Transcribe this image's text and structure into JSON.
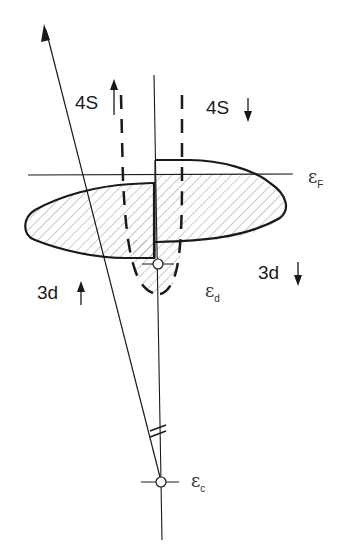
{
  "diagram": {
    "labels": {
      "spin_up_4s": "4S",
      "spin_down_4s": "4S",
      "spin_down_3d": "3d",
      "spin_up_3d": "3d",
      "fermi_symbol": "ε",
      "fermi_sub": "F",
      "d_level_symbol": "ε",
      "d_level_sub": "d",
      "c_level_symbol": "ε",
      "c_level_sub": "c"
    },
    "colors": {
      "ink": "#1a1a1a",
      "hatch": "#555555",
      "background": "#ffffff"
    }
  }
}
